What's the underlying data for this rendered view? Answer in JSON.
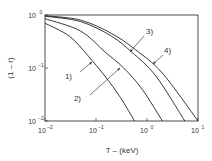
{
  "chart_data": {
    "type": "line",
    "title": "",
    "xlabel": "T – (keV)",
    "ylabel": "(1 – r)",
    "xscale": "log",
    "yscale": "log",
    "xlim": [
      0.01,
      10
    ],
    "ylim": [
      0.01,
      1
    ],
    "x_ticks": [
      {
        "base": "10",
        "exp": "−2"
      },
      {
        "base": "10",
        "exp": "−1"
      },
      {
        "base": "10",
        "exp": "0"
      },
      {
        "base": "10",
        "exp": "1"
      }
    ],
    "y_ticks": [
      {
        "base": "10",
        "exp": "0"
      },
      {
        "base": "10",
        "exp": "−1"
      },
      {
        "base": "10",
        "exp": "−2"
      }
    ],
    "grid": false,
    "legend": "inline labels with arrows",
    "series": [
      {
        "name": "1)",
        "x": [
          0.01,
          0.03,
          0.07,
          0.15,
          0.3,
          0.57
        ],
        "y": [
          0.7,
          0.4,
          0.17,
          0.07,
          0.028,
          0.01
        ]
      },
      {
        "name": "2)",
        "x": [
          0.01,
          0.05,
          0.15,
          0.35,
          0.8,
          2.0
        ],
        "y": [
          0.85,
          0.5,
          0.2,
          0.1,
          0.04,
          0.01
        ]
      },
      {
        "name": "3)",
        "x": [
          0.01,
          0.05,
          0.2,
          0.5,
          1.5,
          5.5
        ],
        "y": [
          0.95,
          0.75,
          0.4,
          0.2,
          0.07,
          0.01
        ]
      },
      {
        "name": "4)",
        "x": [
          0.01,
          0.05,
          0.2,
          0.6,
          2.0,
          10.0
        ],
        "y": [
          0.97,
          0.8,
          0.45,
          0.22,
          0.08,
          0.01
        ]
      }
    ]
  }
}
